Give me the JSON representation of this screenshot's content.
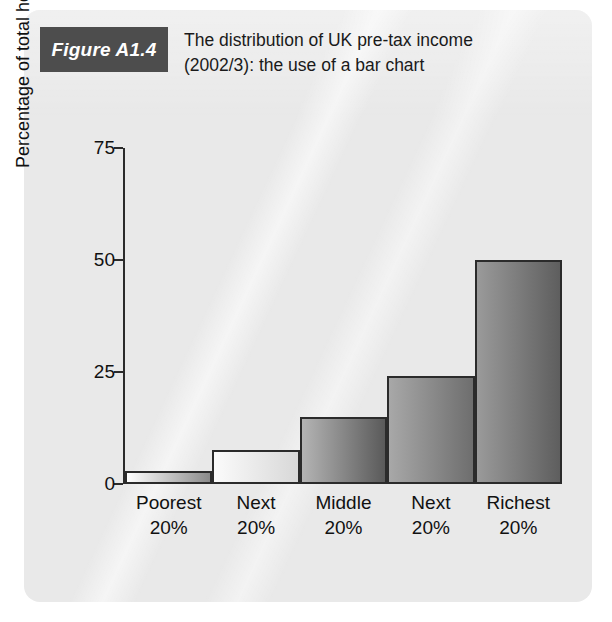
{
  "figure": {
    "badge": "Figure A1.4",
    "title": "The distribution of UK pre-tax income (2002/3): the use of a bar chart",
    "title_line1": "The distribution of UK pre-tax income",
    "title_line2": "(2002/3): the use of a bar chart"
  },
  "colors": {
    "panel_background": "#e9e9e9",
    "badge_background": "#4d4d4d",
    "badge_text": "#ffffff",
    "axis": "#2b2b2b",
    "text": "#111111"
  },
  "chart_data": {
    "type": "bar",
    "title": "The distribution of UK pre-tax income (2002/3): the use of a bar chart",
    "xlabel": "",
    "ylabel": "Percentage of total household income",
    "categories": [
      "Poorest 20%",
      "Next 20%",
      "Middle 20%",
      "Next 20%",
      "Richest 20%"
    ],
    "category_lines": [
      [
        "Poorest",
        "20%"
      ],
      [
        "Next",
        "20%"
      ],
      [
        "Middle",
        "20%"
      ],
      [
        "Next",
        "20%"
      ],
      [
        "Richest",
        "20%"
      ]
    ],
    "values": [
      3,
      7.5,
      15,
      24,
      50
    ],
    "ylim": [
      0,
      75
    ],
    "yticks": [
      0,
      25,
      50,
      75
    ],
    "ytick_labels": [
      "0",
      "25",
      "50",
      "75"
    ],
    "grid": false,
    "legend": "none",
    "bar_fills": [
      {
        "from": "#ffffff",
        "to": "#8a8a8a"
      },
      {
        "from": "#fbfbfb",
        "to": "#d8d8d8"
      },
      {
        "from": "#b4b4b4",
        "to": "#5a5a5a"
      },
      {
        "from": "#a8a8a8",
        "to": "#6e6e6e"
      },
      {
        "from": "#9a9a9a",
        "to": "#5e5e5e"
      }
    ]
  }
}
